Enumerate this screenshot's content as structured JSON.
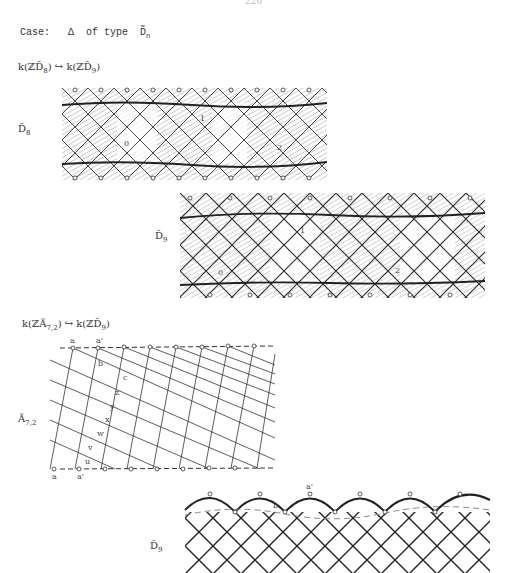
{
  "page": {
    "page_number": "220",
    "case_heading": {
      "prefix": "Case:",
      "symbol": "Δ",
      "middle": "of type",
      "type_symbol": "D̃",
      "type_sub": "n"
    }
  },
  "section1": {
    "map_label": "k(ℤD̃₈) ⟶ k(ℤD̃₉)",
    "map_left": "k(ℤD̃",
    "map_left_sub": "8",
    "map_arrow": "↪",
    "map_right": "k(ℤD̃",
    "map_right_sub": "9",
    "close": ")",
    "diagram_top": {
      "label": "D̃",
      "label_sub": "8",
      "region_labels": [
        "0",
        "1",
        "2"
      ]
    },
    "diagram_bottom": {
      "label": "D̃",
      "label_sub": "9",
      "region_labels": [
        "0",
        "1",
        "2"
      ]
    }
  },
  "section2": {
    "map_left": "k(ℤÃ",
    "map_left_sub": "7,2",
    "map_arrow": "↪",
    "map_right": "k(ℤD̃",
    "map_right_sub": "9",
    "close": ")",
    "diagram_a": {
      "label": "Ã",
      "label_sub": "7,2",
      "vertex_labels_top": [
        "a",
        "a'"
      ],
      "vertex_labels_bottom": [
        "a",
        "a'"
      ],
      "vertex_labels_diag": [
        "b",
        "c",
        "z",
        "y",
        "x",
        "w",
        "v",
        "u"
      ]
    },
    "diagram_d": {
      "label": "D̃",
      "label_sub": "9",
      "vertex_labels": [
        "a'",
        "b"
      ]
    }
  }
}
